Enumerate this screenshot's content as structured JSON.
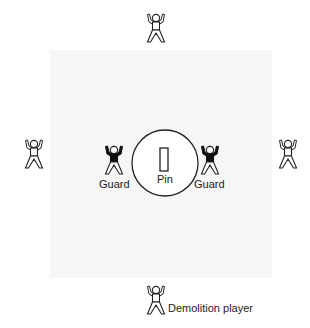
{
  "diagram": {
    "type": "sport-positioning",
    "labels": {
      "pin": "Pin",
      "guard_left": "Guard",
      "guard_right": "Guard",
      "demolition_player": "Demolition player"
    },
    "players": [
      {
        "id": "top",
        "role": "thrower",
        "filled": false
      },
      {
        "id": "left",
        "role": "thrower",
        "filled": false
      },
      {
        "id": "right",
        "role": "thrower",
        "filled": false
      },
      {
        "id": "bottom",
        "role": "demolition-player",
        "filled": false
      },
      {
        "id": "guard-left",
        "role": "guard",
        "filled": true
      },
      {
        "id": "guard-right",
        "role": "guard",
        "filled": true
      }
    ],
    "colors": {
      "stroke": "#222222",
      "guard_fill": "#111111",
      "field": "#f6f6f6"
    }
  }
}
